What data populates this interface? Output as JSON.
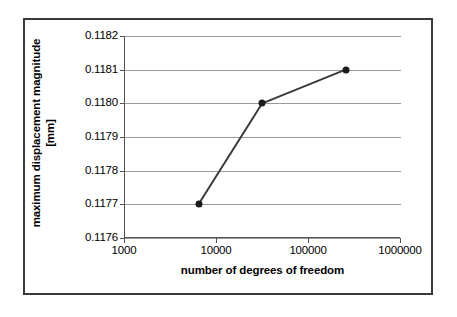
{
  "chart_data": {
    "type": "line",
    "title": "",
    "xlabel": "number of degrees of freedom",
    "ylabel": "maximum displacement magnitude [mm]",
    "ylabel_line1": "maximum displacement magnitude",
    "ylabel_line2": "[mm]",
    "xscale": "log",
    "yscale": "linear",
    "xlim": [
      1000,
      1000000
    ],
    "ylim": [
      0.1176,
      0.1182
    ],
    "xticks": [
      1000,
      10000,
      100000,
      1000000
    ],
    "xtick_labels": [
      "1000",
      "10000",
      "100000",
      "1000000"
    ],
    "yticks": [
      0.1176,
      0.1177,
      0.1178,
      0.1179,
      0.118,
      0.1181,
      0.1182
    ],
    "ytick_labels": [
      "0.1176",
      "0.1177",
      "0.1178",
      "0.1179",
      "0.1180",
      "0.1181",
      "0.1182"
    ],
    "grid": "horizontal",
    "legend": "none",
    "series": [
      {
        "name": "maximum displacement magnitude",
        "marker": "filled-circle",
        "line_color": "#3a3a3a",
        "marker_color": "#1a1a1a",
        "x": [
          6300,
          31000,
          250000
        ],
        "y": [
          0.1177,
          0.118,
          0.1181
        ]
      }
    ],
    "points": [
      {
        "x": 6300,
        "y": 0.1177
      },
      {
        "x": 31000,
        "y": 0.118
      },
      {
        "x": 250000,
        "y": 0.1181
      }
    ]
  },
  "colors": {
    "frame": "#3a3a3a",
    "axis": "#555555",
    "grid": "#9a9a9a",
    "data_line": "#3a3a3a",
    "marker": "#1a1a1a",
    "background": "#ffffff",
    "text": "#000000"
  }
}
